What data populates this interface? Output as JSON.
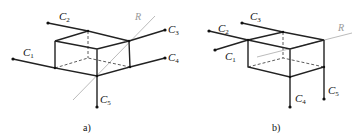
{
  "figure": {
    "panels": [
      {
        "id": "a",
        "caption": "a)",
        "line_label": "R",
        "conductors": [
          {
            "name": "C",
            "sub": "1"
          },
          {
            "name": "C",
            "sub": "2"
          },
          {
            "name": "C",
            "sub": "3"
          },
          {
            "name": "C",
            "sub": "4"
          },
          {
            "name": "C",
            "sub": "5"
          }
        ]
      },
      {
        "id": "b",
        "caption": "b)",
        "line_label": "R",
        "conductors": [
          {
            "name": "C",
            "sub": "1"
          },
          {
            "name": "C",
            "sub": "2"
          },
          {
            "name": "C",
            "sub": "3"
          },
          {
            "name": "C",
            "sub": "4"
          },
          {
            "name": "C",
            "sub": "5"
          }
        ]
      }
    ]
  }
}
